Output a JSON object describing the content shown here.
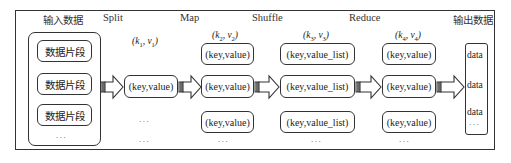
{
  "headers": {
    "input": "输入数据",
    "split": "Split",
    "map": "Map",
    "shuffle": "Shuffle",
    "reduce": "Reduce",
    "output": "输出数据"
  },
  "input_block": {
    "fragments": [
      "数据片段",
      "数据片段",
      "数据片段"
    ],
    "ellipsis": "..."
  },
  "pairs": {
    "k1v1": {
      "k": "k",
      "ksub": "1",
      "v": "v",
      "vsub": "1"
    },
    "k2v2": {
      "k": "k",
      "ksub": "2",
      "v": "v",
      "vsub": "2"
    },
    "k3v3": {
      "k": "k",
      "ksub": "3",
      "v": "v",
      "vsub": "3"
    },
    "k4v4": {
      "k": "k",
      "ksub": "4",
      "v": "v",
      "vsub": "4"
    }
  },
  "split_column": {
    "box": "(key,value)",
    "ellipsis1": "...",
    "ellipsis2": "..."
  },
  "map_column": {
    "boxes": [
      "(key,value)",
      "(key,value)",
      "(key,value)"
    ],
    "ellipsis": "..."
  },
  "shuffle_column": {
    "boxes": [
      "(key,value_list)",
      "(key,value_list)",
      "(key,value_list)"
    ],
    "ellipsis": "..."
  },
  "reduce_column": {
    "boxes": [
      "(key,value)",
      "(key,value)",
      "(key,value)"
    ],
    "ellipsis": "..."
  },
  "output_block": {
    "items": [
      "data",
      "data",
      "data"
    ],
    "ellipsis": "..."
  },
  "colors": {
    "stroke": "#333333",
    "background": "#ffffff"
  }
}
